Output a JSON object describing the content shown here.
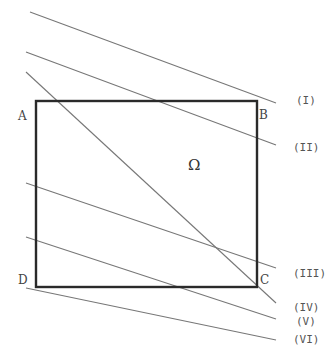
{
  "diagram": {
    "region": {
      "symbol": "Ω",
      "vertices": [
        {
          "name": "A",
          "x": 36,
          "y": 101
        },
        {
          "name": "B",
          "x": 257,
          "y": 101
        },
        {
          "name": "C",
          "x": 257,
          "y": 287
        },
        {
          "name": "D",
          "x": 36,
          "y": 287
        }
      ],
      "stroke": "#2a2a2a"
    },
    "lines": [
      {
        "label": "(I)",
        "x1": 30,
        "y1": 12,
        "x2": 276,
        "y2": 103
      },
      {
        "label": "(II)",
        "x1": 26,
        "y1": 52,
        "x2": 276,
        "y2": 145
      },
      {
        "label": "(III)",
        "x1": 26,
        "y1": 183,
        "x2": 276,
        "y2": 268
      },
      {
        "label": "(IV)",
        "x1": 26,
        "y1": 72,
        "x2": 276,
        "y2": 303
      },
      {
        "label": "(V)",
        "x1": 26,
        "y1": 237,
        "x2": 276,
        "y2": 319
      },
      {
        "label": "(VI)",
        "x1": 26,
        "y1": 288,
        "x2": 276,
        "y2": 340
      }
    ],
    "line_stroke": "#777777",
    "labels": {
      "A": "A",
      "B": "B",
      "C": "C",
      "D": "D",
      "omega": "Ω",
      "I": "(I)",
      "II": "(II)",
      "III": "(III)",
      "IV": "(IV)",
      "V": "(V)",
      "VI": "(VI)"
    }
  }
}
